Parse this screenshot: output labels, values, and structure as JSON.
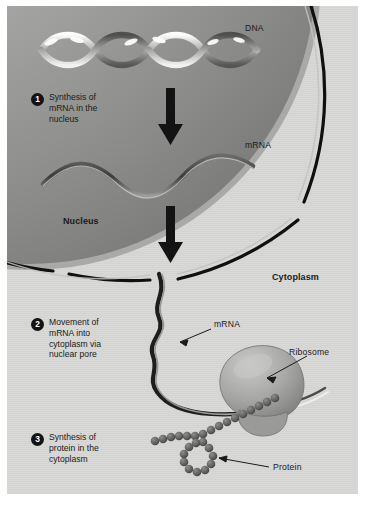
{
  "figure": {
    "panel_background": "#d8d8d6",
    "page_background": "#ffffff"
  },
  "labels": {
    "dna": "DNA",
    "mrna_nucleus": "mRNA",
    "nucleus": "Nucleus",
    "cytoplasm": "Cytoplasm",
    "mrna_cytoplasm": "mRNA",
    "ribosome": "Ribosome",
    "protein": "Protein"
  },
  "steps": [
    {
      "number": "1",
      "text": "Synthesis of\nmRNA in the\nnucleus"
    },
    {
      "number": "2",
      "text": "Movement of\nmRNA into\ncytoplasm via\nnuclear pore"
    },
    {
      "number": "3",
      "text": "Synthesis of\nprotein in the\ncytoplasm"
    }
  ],
  "colors": {
    "nucleus_fill_light": "#b9b9b7",
    "nucleus_fill_dark": "#7e7e7e",
    "membrane_line": "#101010",
    "membrane_edge": "#a5a5a3",
    "arrow": "#131313",
    "text": "#1b1b1b",
    "protein_bead": "#6d6d6b",
    "ribosome_fill": "#a9a9a7"
  },
  "structures": {
    "dna_helix": "double-helix-ribbon",
    "mrna_strand_nucleus": "wavy-ribbon",
    "mrna_strand_cytoplasm": "zigzag-ribbon-through-nuclear-pore",
    "ribosome": "two-lobed-organelle",
    "protein_chain": "bead-chain-loop",
    "arrows": 2,
    "nuclear_pore": "gap-in-nuclear-membrane"
  }
}
